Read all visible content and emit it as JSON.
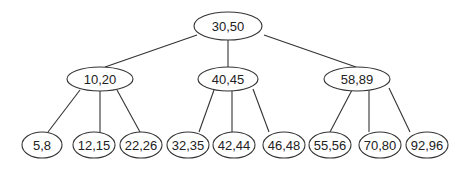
{
  "tree": {
    "type": "B-tree",
    "nodes": [
      {
        "id": "root",
        "label": "30,50",
        "cx": 228,
        "cy": 26,
        "rx": 34,
        "ry": 14
      },
      {
        "id": "n1",
        "label": "10,20",
        "cx": 100,
        "cy": 79,
        "rx": 33,
        "ry": 12
      },
      {
        "id": "n2",
        "label": "40,45",
        "cx": 228,
        "cy": 79,
        "rx": 30,
        "ry": 12
      },
      {
        "id": "n3",
        "label": "58,89",
        "cx": 357,
        "cy": 79,
        "rx": 33,
        "ry": 12
      },
      {
        "id": "l1",
        "label": "5,8",
        "cx": 42,
        "cy": 145,
        "rx": 20,
        "ry": 13
      },
      {
        "id": "l2",
        "label": "12,15",
        "cx": 94,
        "cy": 145,
        "rx": 21,
        "ry": 13
      },
      {
        "id": "l3",
        "label": "22,26",
        "cx": 141,
        "cy": 145,
        "rx": 21,
        "ry": 13
      },
      {
        "id": "l4",
        "label": "32,35",
        "cx": 188,
        "cy": 145,
        "rx": 21,
        "ry": 13
      },
      {
        "id": "l5",
        "label": "42,44",
        "cx": 234,
        "cy": 145,
        "rx": 21,
        "ry": 13
      },
      {
        "id": "l6",
        "label": "46,48",
        "cx": 284,
        "cy": 145,
        "rx": 21,
        "ry": 13
      },
      {
        "id": "l7",
        "label": "55,56",
        "cx": 330,
        "cy": 145,
        "rx": 21,
        "ry": 13
      },
      {
        "id": "l8",
        "label": "70,80",
        "cx": 380,
        "cy": 145,
        "rx": 21,
        "ry": 13
      },
      {
        "id": "l9",
        "label": "92,96",
        "cx": 427,
        "cy": 145,
        "rx": 21,
        "ry": 13
      }
    ],
    "edges": [
      {
        "from": "root",
        "to": "n1",
        "x1": 197,
        "y1": 35,
        "x2": 105,
        "y2": 67
      },
      {
        "from": "root",
        "to": "n2",
        "x1": 228,
        "y1": 40,
        "x2": 228,
        "y2": 67
      },
      {
        "from": "root",
        "to": "n3",
        "x1": 264,
        "y1": 35,
        "x2": 356,
        "y2": 67
      },
      {
        "from": "n1",
        "to": "l1",
        "x1": 80,
        "y1": 90,
        "x2": 48,
        "y2": 132
      },
      {
        "from": "n1",
        "to": "l2",
        "x1": 100,
        "y1": 91,
        "x2": 100,
        "y2": 132
      },
      {
        "from": "n1",
        "to": "l3",
        "x1": 117,
        "y1": 90,
        "x2": 140,
        "y2": 132
      },
      {
        "from": "n2",
        "to": "l4",
        "x1": 214,
        "y1": 90,
        "x2": 199,
        "y2": 132
      },
      {
        "from": "n2",
        "to": "l5",
        "x1": 232,
        "y1": 91,
        "x2": 232,
        "y2": 132
      },
      {
        "from": "n2",
        "to": "l6",
        "x1": 253,
        "y1": 89,
        "x2": 269,
        "y2": 132
      },
      {
        "from": "n3",
        "to": "l7",
        "x1": 352,
        "y1": 90,
        "x2": 330,
        "y2": 132
      },
      {
        "from": "n3",
        "to": "l8",
        "x1": 369,
        "y1": 91,
        "x2": 369,
        "y2": 132
      },
      {
        "from": "n3",
        "to": "l9",
        "x1": 389,
        "y1": 88,
        "x2": 410,
        "y2": 132
      }
    ]
  },
  "colors": {
    "stroke": "#333333",
    "fill": "#ffffff",
    "text": "#222222"
  }
}
